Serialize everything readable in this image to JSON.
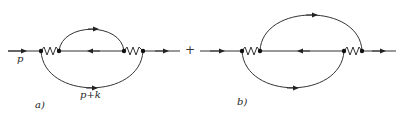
{
  "diagrams": [
    {
      "id": "a",
      "caption": "a)",
      "labels": {
        "incoming_momentum": "p",
        "loop_momentum": "p+k"
      }
    },
    {
      "id": "b",
      "caption": "b)"
    }
  ],
  "operator": "+",
  "colors": {
    "line": "#333333",
    "vertex": "#111111"
  }
}
